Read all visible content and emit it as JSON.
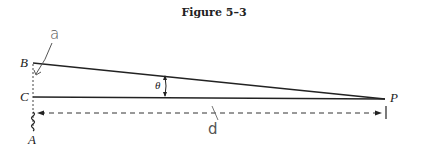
{
  "figure": {
    "title": "Figure 5–3",
    "points": {
      "B": "B",
      "C": "C",
      "A": "A",
      "P": "P"
    },
    "angle_label": "θ",
    "handwritten": {
      "a": "a",
      "d": "d"
    },
    "colors": {
      "line": "#222222",
      "pencil": "#555555"
    }
  }
}
